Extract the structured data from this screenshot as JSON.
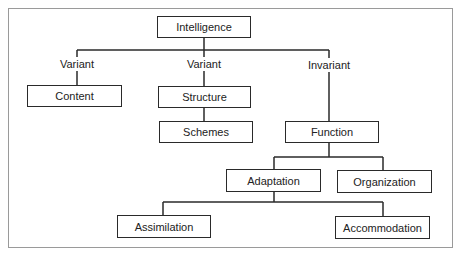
{
  "diagram": {
    "type": "hierarchy",
    "root": "Intelligence",
    "nodes": {
      "intelligence": "Intelligence",
      "content": "Content",
      "structure": "Structure",
      "schemes": "Schemes",
      "function": "Function",
      "adaptation": "Adaptation",
      "organization": "Organization",
      "assimilation": "Assimilation",
      "accommodation": "Accommodation"
    },
    "edge_labels": {
      "content": "Variant",
      "structure": "Variant",
      "function": "Invariant"
    },
    "edges": [
      [
        "Intelligence",
        "Content",
        "Variant"
      ],
      [
        "Intelligence",
        "Structure",
        "Variant"
      ],
      [
        "Intelligence",
        "Function",
        "Invariant"
      ],
      [
        "Structure",
        "Schemes",
        ""
      ],
      [
        "Function",
        "Adaptation",
        ""
      ],
      [
        "Function",
        "Organization",
        ""
      ],
      [
        "Adaptation",
        "Assimilation",
        ""
      ],
      [
        "Adaptation",
        "Accommodation",
        ""
      ]
    ],
    "colors": {
      "line": "#2a2a2a",
      "frame": "#9a9a9a",
      "background": "#ffffff"
    }
  }
}
